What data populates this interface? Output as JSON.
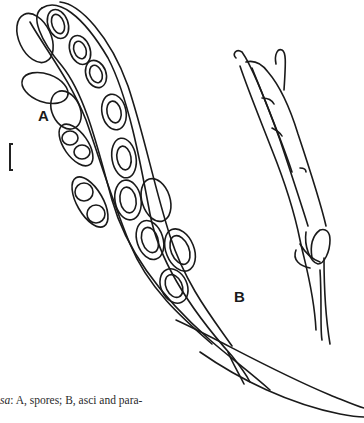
{
  "figure": {
    "labels": {
      "a": "A",
      "b": "B"
    },
    "panels": [
      {
        "id": "A",
        "description": "spores"
      },
      {
        "id": "B",
        "description": "asci and paraphyses"
      }
    ],
    "colors": {
      "ink": "#1a1a1a",
      "background": "#ffffff"
    }
  },
  "caption": {
    "italic_fragment": "sa",
    "text": ": A, spores; B, asci and para-"
  }
}
